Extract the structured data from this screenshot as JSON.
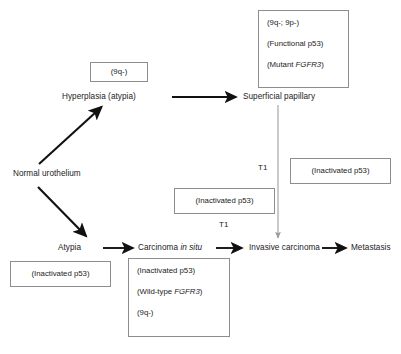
{
  "diagram": {
    "nodes": [
      {
        "id": "normal",
        "label": "Normal urothelium"
      },
      {
        "id": "hyperplasia",
        "label": "Hyperplasia (atypia)"
      },
      {
        "id": "superficial",
        "label": "Superficial papillary"
      },
      {
        "id": "atypia",
        "label": "Atypia"
      },
      {
        "id": "cis_pre",
        "label": "Carcinoma ",
        "cis_italic": "in situ"
      },
      {
        "id": "invasive",
        "label": "Invasive carcinoma"
      },
      {
        "id": "metastasis",
        "label": "Metastasis"
      }
    ],
    "edge_labels": [
      {
        "id": "t1_upper",
        "label": "T1"
      },
      {
        "id": "t1_lower",
        "label": "T1"
      }
    ],
    "annotations": {
      "hyperplasia_box": {
        "lines": [
          "(9q-)"
        ]
      },
      "superficial_box": {
        "line1": "(9q-; 9p-)",
        "line2": "(Functional p53)",
        "line3_prefix": "(Mutant ",
        "line3_gene": "FGFR3",
        "line3_suffix": ")"
      },
      "invasive_right_box": {
        "lines": [
          "(Inactivated p53)"
        ]
      },
      "middle_box": {
        "lines": [
          "(Inactivated p53)"
        ]
      },
      "atypia_box": {
        "lines": [
          "(Inactivated p53)"
        ]
      },
      "cis_box": {
        "line1": "(Inactivated p53)",
        "line2_prefix": "(Wild-type ",
        "line2_gene": "FGFR3",
        "line2_suffix": ")",
        "line3": "(9q-)"
      }
    },
    "colors": {
      "text": "#1b1b1b",
      "box_border": "#8d8d8d",
      "arrow_strong": "#111111",
      "arrow_faint": "#9a9a9a",
      "background": "#ffffff"
    }
  }
}
